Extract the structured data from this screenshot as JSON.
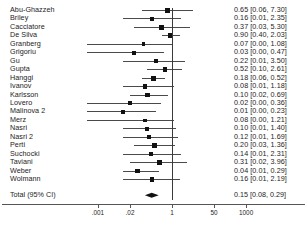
{
  "chart_data": {
    "type": "forest",
    "title": "",
    "xlabel": "",
    "ylabel": "",
    "scale": "log",
    "null_value": 1,
    "axis": {
      "ticks": [
        ".001",
        ".02",
        "1",
        "50",
        "1000"
      ],
      "tick_values": [
        0.001,
        0.02,
        1,
        50,
        1000
      ],
      "xlim": [
        0.0002,
        6000
      ],
      "grid": false
    },
    "columns": {
      "study": "",
      "effect_ci": ""
    },
    "studies": [
      {
        "name": "Abu-Ghazzeh",
        "effect": 0.65,
        "lower": 0.06,
        "upper": 7.3,
        "text": "0.65 [0.06, 7.30]"
      },
      {
        "name": "Briley",
        "effect": 0.16,
        "lower": 0.01,
        "upper": 2.35,
        "text": "0.16 [0.01, 2.35]"
      },
      {
        "name": "Cacciatore",
        "effect": 0.37,
        "lower": 0.03,
        "upper": 5.3,
        "text": "0.37 [0.03, 5.30]"
      },
      {
        "name": "De Silva",
        "effect": 0.9,
        "lower": 0.4,
        "upper": 2.03,
        "text": "0.90 [0.40, 2.03]"
      },
      {
        "name": "Granberg",
        "effect": 0.07,
        "lower": 0.0,
        "upper": 1.08,
        "text": "0.07 [0.00, 1.08]"
      },
      {
        "name": "Grigoriu",
        "effect": 0.03,
        "lower": 0.0,
        "upper": 0.47,
        "text": "0.03 [0.00, 0.47]"
      },
      {
        "name": "Gu",
        "effect": 0.22,
        "lower": 0.01,
        "upper": 3.5,
        "text": "0.22 [0.01, 3.50]"
      },
      {
        "name": "Gupta",
        "effect": 0.52,
        "lower": 0.1,
        "upper": 2.61,
        "text": "0.52 [0.10, 2.61]"
      },
      {
        "name": "Hanggi",
        "effect": 0.18,
        "lower": 0.06,
        "upper": 0.52,
        "text": "0.18 [0.06, 0.52]"
      },
      {
        "name": "Ivanov",
        "effect": 0.08,
        "lower": 0.01,
        "upper": 1.18,
        "text": "0.08 [0.01, 1.18]"
      },
      {
        "name": "Karlsson",
        "effect": 0.1,
        "lower": 0.02,
        "upper": 0.69,
        "text": "0.10 [0.02, 0.69]"
      },
      {
        "name": "Lovero",
        "effect": 0.02,
        "lower": 0.0,
        "upper": 0.36,
        "text": "0.02 [0.00, 0.36]"
      },
      {
        "name": "Malinova 2",
        "effect": 0.01,
        "lower": 0.0,
        "upper": 0.23,
        "text": "0.01 [0.00, 0.23]"
      },
      {
        "name": "Merz",
        "effect": 0.08,
        "lower": 0.0,
        "upper": 1.21,
        "text": "0.08 [0.00, 1.21]"
      },
      {
        "name": "Nasri",
        "effect": 0.1,
        "lower": 0.01,
        "upper": 1.4,
        "text": "0.10 [0.01, 1.40]"
      },
      {
        "name": "Nasri 2",
        "effect": 0.12,
        "lower": 0.01,
        "upper": 1.69,
        "text": "0.12 [0.01, 1.69]"
      },
      {
        "name": "Perti",
        "effect": 0.2,
        "lower": 0.03,
        "upper": 1.36,
        "text": "0.20 [0.03, 1.36]"
      },
      {
        "name": "Suchocki",
        "effect": 0.14,
        "lower": 0.01,
        "upper": 2.31,
        "text": "0.14 [0.01, 2.31]"
      },
      {
        "name": "Taviani",
        "effect": 0.31,
        "lower": 0.02,
        "upper": 3.96,
        "text": "0.31 [0.02, 3.96]"
      },
      {
        "name": "Weber",
        "effect": 0.04,
        "lower": 0.01,
        "upper": 0.29,
        "text": "0.04 [0.01, 0.29]"
      },
      {
        "name": "Wolmann",
        "effect": 0.16,
        "lower": 0.01,
        "upper": 2.19,
        "text": "0.16 [0.01, 2.19]"
      }
    ],
    "summary": {
      "name": "Total (95% CI)",
      "effect": 0.15,
      "lower": 0.08,
      "upper": 0.29,
      "text": "0.15 [0.08, 0.29]"
    },
    "colors": {
      "marker": "#111111",
      "ci_line": "#4a4a4a",
      "null_line": "#3a3a3a",
      "axis": "#555555",
      "diamond": "#111111",
      "text": "#1d1d1d"
    }
  }
}
